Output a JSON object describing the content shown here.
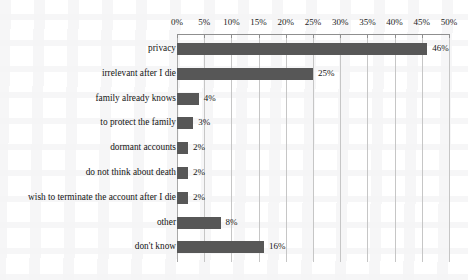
{
  "chart_data": {
    "type": "bar",
    "orientation": "horizontal",
    "title": "",
    "subtitle": "",
    "xlabel": "",
    "ylabel": "",
    "xlim": [
      0,
      50
    ],
    "xtick_step": 5,
    "grid": true,
    "legend": "none",
    "axis_position": "top",
    "value_label_suffix": "%",
    "categories": [
      "privacy",
      "irrelevant after I die",
      "family already knows",
      "to protect the family",
      "dormant accounts",
      "do not think about death",
      "wish to terminate the account after I die",
      "other",
      "don't know"
    ],
    "values": [
      46,
      25,
      4,
      3,
      2,
      2,
      2,
      8,
      16
    ],
    "value_labels": [
      "46%",
      "25%",
      "4%",
      "3%",
      "2%",
      "2%",
      "2%",
      "8%",
      "16%"
    ],
    "tick_labels": [
      "0%",
      "5%",
      "10%",
      "15%",
      "20%",
      "25%",
      "30%",
      "35%",
      "40%",
      "45%",
      "50%"
    ],
    "tick_values": [
      0,
      5,
      10,
      15,
      20,
      25,
      30,
      35,
      40,
      45,
      50
    ],
    "colors": {
      "bar": "#575757",
      "gridline": "#c6c6c6",
      "axis": "#8f8f8f",
      "text": "#141414",
      "background": "#ffffff"
    }
  }
}
